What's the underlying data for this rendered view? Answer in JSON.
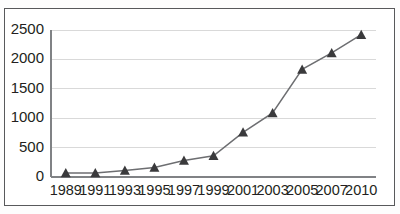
{
  "chart_data": {
    "type": "line",
    "title": "",
    "subtitle": "",
    "xlabel": "",
    "ylabel": "",
    "categories": [
      "1989",
      "1991",
      "1993",
      "1995",
      "1997",
      "1999",
      "2001",
      "2003",
      "2005",
      "2007",
      "2010"
    ],
    "values": [
      70,
      70,
      110,
      160,
      280,
      360,
      760,
      1090,
      1830,
      2110,
      2420
    ],
    "series": [
      {
        "name": "",
        "values": [
          70,
          70,
          110,
          160,
          280,
          360,
          760,
          1090,
          1830,
          2110,
          2420
        ]
      }
    ],
    "ylim": [
      0,
      2500
    ],
    "yticks": [
      0,
      500,
      1000,
      1500,
      2000,
      2500
    ],
    "ytick_labels": [
      "0",
      "500",
      "1000",
      "1500",
      "2000",
      "2500"
    ],
    "xtick_labels": [
      "1989",
      "1991",
      "1993",
      "1995",
      "1997",
      "1999",
      "2001",
      "2003",
      "2005",
      "2007",
      "2010"
    ],
    "grid": "horizontal",
    "legend": "none",
    "marker": "triangle",
    "colors": {
      "line": "#6d6e71",
      "marker": "#3a3a3c",
      "gridline": "#d9d9d9",
      "axis": "#808285",
      "frame": "#58595b",
      "text": "#231f20",
      "background": "#ffffff"
    }
  }
}
